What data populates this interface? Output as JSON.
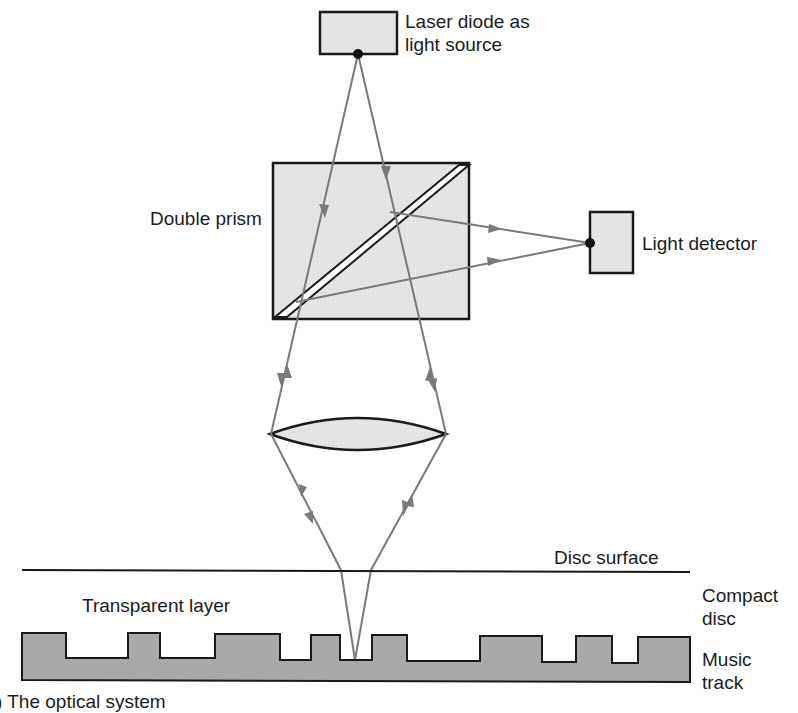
{
  "diagram": {
    "labels": {
      "laser_line1": "Laser diode as",
      "laser_line2": "light source",
      "prism": "Double prism",
      "detector": "Light detector",
      "disc_surface": "Disc surface",
      "transparent_layer": "Transparent layer",
      "compact_line1": "Compact",
      "compact_line2": "disc",
      "music_line1": "Music",
      "music_line2": "track",
      "caption": ") The optical system"
    },
    "colors": {
      "fill_light": "#e6e6e6",
      "fill_track": "#a9a9a9",
      "ray": "#7a7a7a",
      "outline": "#1a1a1a"
    }
  }
}
